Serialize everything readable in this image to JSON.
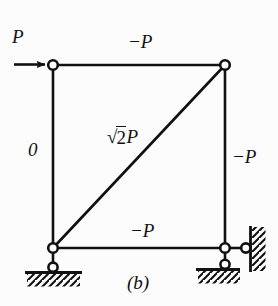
{
  "figure": {
    "caption": "(b)",
    "type": "truss-free-body-diagram",
    "applied_load": {
      "label": "P",
      "direction": "right",
      "location": "top-left-node",
      "arrow_icon": "arrow-right-icon"
    },
    "members": [
      {
        "id": "top-chord",
        "label": "−P",
        "orientation": "horizontal",
        "position": "top"
      },
      {
        "id": "left-column",
        "label": "0",
        "orientation": "vertical",
        "position": "left"
      },
      {
        "id": "right-column",
        "label": "−P",
        "orientation": "vertical",
        "position": "right"
      },
      {
        "id": "bottom-chord",
        "label": "−P",
        "orientation": "horizontal",
        "position": "bottom"
      },
      {
        "id": "diagonal",
        "label_radical": "√",
        "label_radicand": "2",
        "label_suffix": "P",
        "orientation": "diagonal",
        "position": "bottom-left-to-top-right"
      }
    ],
    "labels": {
      "load_p": "P",
      "top_chord": "−P",
      "left_column": "0",
      "right_column": "−P",
      "bottom_chord": "−P",
      "diagonal_radical": "√",
      "diagonal_radicand": "2",
      "diagonal_suffix": "P"
    },
    "nodes": [
      {
        "id": "node-top-left",
        "x": 53,
        "y": 65
      },
      {
        "id": "node-top-right",
        "x": 225,
        "y": 65
      },
      {
        "id": "node-bottom-left",
        "x": 53,
        "y": 248
      },
      {
        "id": "node-bottom-right",
        "x": 225,
        "y": 248
      }
    ],
    "supports": [
      {
        "id": "support-left-roller",
        "type": "roller-on-ground",
        "x": 53,
        "y": 268
      },
      {
        "id": "support-right-ground-roller",
        "type": "roller-on-ground",
        "x": 225,
        "y": 265
      },
      {
        "id": "support-right-wall-roller",
        "type": "roller-on-wall",
        "x": 246,
        "y": 248
      }
    ],
    "colors": {
      "line": "#111111",
      "background": "#fcfcfc",
      "node_fill": "#ffffff"
    }
  }
}
